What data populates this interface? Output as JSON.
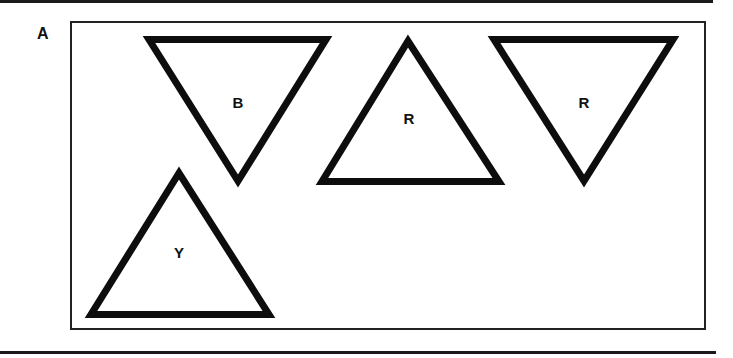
{
  "panel": {
    "label": "A"
  },
  "triangles": [
    {
      "id": "t1",
      "label": "B",
      "orientation": "down",
      "points": "149,39.5 326,39.5 238,181",
      "label_pos": {
        "x": 238,
        "y": 108
      }
    },
    {
      "id": "t2",
      "label": "R",
      "orientation": "up",
      "points": "408,41 322,181.5 499,181.5",
      "label_pos": {
        "x": 409,
        "y": 124
      }
    },
    {
      "id": "t3",
      "label": "R",
      "orientation": "down",
      "points": "494,39.5 673,39.5 584,181",
      "label_pos": {
        "x": 584,
        "y": 108
      }
    },
    {
      "id": "t4",
      "label": "Y",
      "orientation": "up",
      "points": "179,173 91,314.5 269,314.5",
      "label_pos": {
        "x": 179,
        "y": 258
      }
    }
  ],
  "colors": {
    "stroke": "#0d0d0d",
    "background": "#ffffff"
  }
}
